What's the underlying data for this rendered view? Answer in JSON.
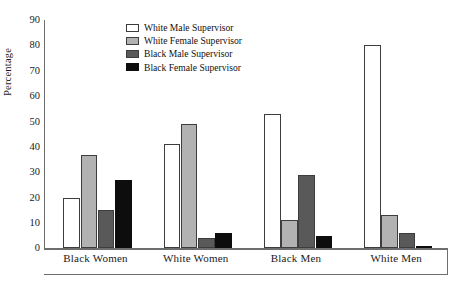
{
  "chart_data": {
    "type": "bar",
    "title": "",
    "subtitle": "",
    "xlabel": "",
    "ylabel": "Percentage",
    "categories": [
      "Black Women",
      "White Women",
      "Black Men",
      "White Men"
    ],
    "series": [
      {
        "name": "White Male Supervisor",
        "color": "#ffffff",
        "values": [
          20,
          41,
          53,
          80
        ]
      },
      {
        "name": "White Female Supervisor",
        "color": "#b2b2b2",
        "values": [
          37,
          49,
          11,
          13
        ]
      },
      {
        "name": "Black Male Supervisor",
        "color": "#595959",
        "values": [
          15,
          4,
          29,
          6
        ]
      },
      {
        "name": "Black Female Supervisor",
        "color": "#0d0d0d",
        "values": [
          27,
          6,
          5,
          1
        ]
      }
    ],
    "ylim": [
      0,
      90
    ],
    "ytick_step": 10,
    "yticks": [
      0,
      10,
      20,
      30,
      40,
      50,
      60,
      70,
      80,
      90
    ],
    "ytick_labels": [
      "0",
      "10",
      "20",
      "30",
      "40",
      "50",
      "60",
      "70",
      "80",
      "90"
    ],
    "grid": false,
    "legend_position": "upper-center-left",
    "axis_color": "#6e6e6e",
    "bar_outline_color": "#3d3d3d",
    "background": "#ffffff"
  }
}
